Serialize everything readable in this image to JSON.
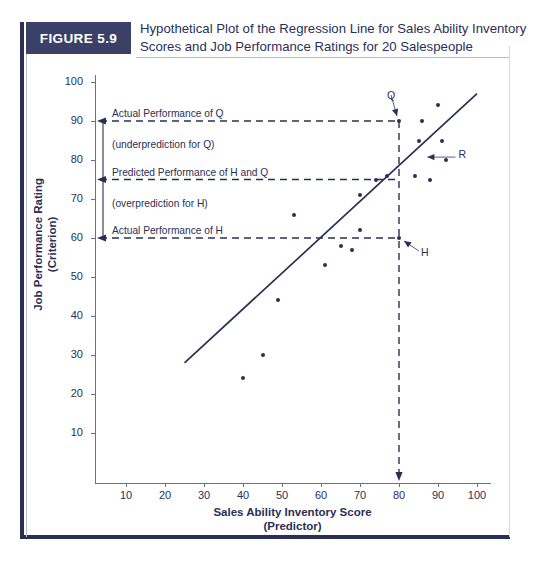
{
  "figure": {
    "badge": "FIGURE 5.9",
    "title_line1": "Hypothetical Plot of the Regression Line for Sales Ability Inventory",
    "title_line2": "Scores and Job Performance Ratings for 20 Salespeople",
    "accent_color": "#2a3055",
    "badge_color": "#3a4066"
  },
  "chart_data": {
    "type": "scatter",
    "title": "Hypothetical Plot of the Regression Line for Sales Ability Inventory Scores and Job Performance Ratings for 20 Salespeople",
    "xlabel_line1": "Sales Ability Inventory Score",
    "xlabel_line2": "(Predictor)",
    "ylabel_line1": "Job Performance Rating",
    "ylabel_line2": "(Criterion)",
    "xlim": [
      0,
      105
    ],
    "ylim": [
      0,
      105
    ],
    "xticks": [
      10,
      20,
      30,
      40,
      50,
      60,
      70,
      80,
      90,
      100
    ],
    "yticks": [
      10,
      20,
      30,
      40,
      50,
      60,
      70,
      80,
      90,
      100
    ],
    "grid": false,
    "legend": "none",
    "points": [
      {
        "x": 40,
        "y": 24
      },
      {
        "x": 45,
        "y": 30
      },
      {
        "x": 49,
        "y": 44
      },
      {
        "x": 53,
        "y": 66
      },
      {
        "x": 61,
        "y": 53
      },
      {
        "x": 65,
        "y": 58
      },
      {
        "x": 68,
        "y": 57
      },
      {
        "x": 70,
        "y": 62
      },
      {
        "x": 70,
        "y": 71
      },
      {
        "x": 74,
        "y": 75
      },
      {
        "x": 77,
        "y": 76
      },
      {
        "x": 80,
        "y": 60
      },
      {
        "x": 80,
        "y": 90
      },
      {
        "x": 84,
        "y": 76
      },
      {
        "x": 85,
        "y": 85
      },
      {
        "x": 86,
        "y": 90
      },
      {
        "x": 88,
        "y": 75
      },
      {
        "x": 90,
        "y": 94
      },
      {
        "x": 91,
        "y": 85
      },
      {
        "x": 92,
        "y": 80
      }
    ],
    "regression_line": {
      "x1": 25,
      "y1": 28,
      "x2": 100,
      "y2": 97
    },
    "reference_lines": [
      {
        "name": "actual-performance-q",
        "orientation": "horizontal",
        "value": 90
      },
      {
        "name": "predicted-performance-hq",
        "orientation": "horizontal",
        "value": 75
      },
      {
        "name": "actual-performance-h",
        "orientation": "horizontal",
        "value": 60
      },
      {
        "name": "case-score",
        "orientation": "vertical",
        "value": 80
      }
    ],
    "annotations": [
      {
        "name": "actual-performance-of-q",
        "text": "Actual Performance of Q",
        "y": 90
      },
      {
        "name": "underprediction-for-q",
        "text": "(underprediction for Q)",
        "y": 82
      },
      {
        "name": "predicted-performance-of-h-and-q",
        "text": "Predicted Performance of H and Q",
        "y": 75
      },
      {
        "name": "overprediction-for-h",
        "text": "(overprediction for H)",
        "y": 67
      },
      {
        "name": "actual-performance-of-h",
        "text": "Actual Performance of H",
        "y": 60
      }
    ],
    "point_labels": [
      {
        "name": "point-label-q",
        "text": "Q",
        "x": 80,
        "y": 90
      },
      {
        "name": "point-label-r",
        "text": "R",
        "x": 86,
        "y": 81
      },
      {
        "name": "point-label-h",
        "text": "H",
        "x": 80,
        "y": 60
      }
    ]
  }
}
